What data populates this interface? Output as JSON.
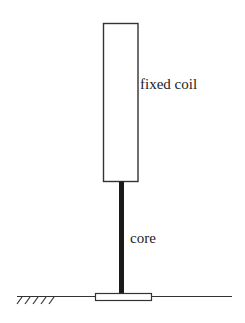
{
  "diagram": {
    "labels": {
      "coil": "fixed coil",
      "core": "core"
    },
    "colors": {
      "stroke": "#333333",
      "core": "#1a1a1a",
      "background": "#ffffff"
    },
    "components": [
      "fixed coil",
      "core",
      "base plate",
      "ground"
    ]
  }
}
